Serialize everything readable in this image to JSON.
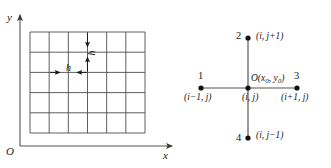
{
  "figure": {
    "colors": {
      "line": "#4d4d4d",
      "axis": "#555555",
      "text": "#1a1a1a",
      "node": "#111111",
      "background": "#ffffff"
    },
    "left_panel": {
      "name": "grid-mesh-diagram",
      "axis_y_label": "y",
      "axis_x_label": "x",
      "origin_label": "O",
      "grid": {
        "columns": 6,
        "rows": 5,
        "x_left": 30,
        "x_right": 145,
        "y_top": 32,
        "y_bottom": 133
      },
      "spacing_label_horizontal": "h",
      "spacing_label_vertical": "h"
    },
    "right_panel": {
      "name": "five-point-stencil-diagram",
      "center": {
        "number": "",
        "point_label": "O(x",
        "point_label_sub1": "0",
        "point_label_mid": ", y",
        "point_label_sub2": "0",
        "point_label_end": ")",
        "index_label": "(i, j)"
      },
      "nodes": [
        {
          "id": "node-1-left",
          "number": "1",
          "index_label": "(i−1, j)"
        },
        {
          "id": "node-2-top",
          "number": "2",
          "index_label": "(i, j+1)"
        },
        {
          "id": "node-3-right",
          "number": "3",
          "index_label": "(i+1, j)"
        },
        {
          "id": "node-4-bottom",
          "number": "4",
          "index_label": "(i, j−1)"
        }
      ]
    }
  }
}
